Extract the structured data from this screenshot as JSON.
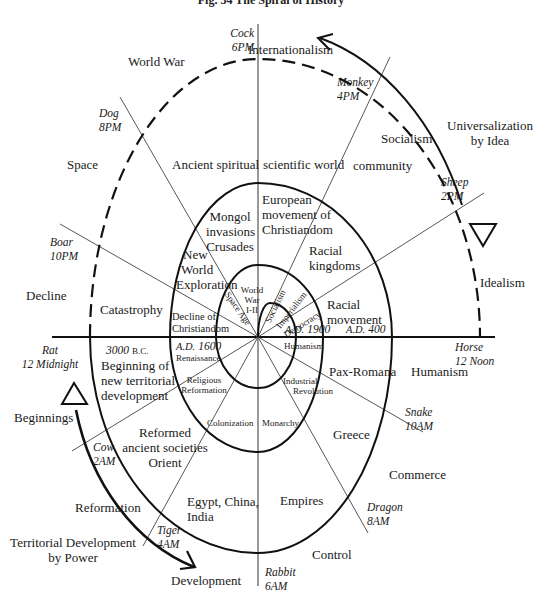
{
  "figure": {
    "title": "Fig. 34   The Spiral of History"
  },
  "time_markers": [
    {
      "animal": "Cock",
      "time": "6PM"
    },
    {
      "animal": "Monkey",
      "time": "4PM"
    },
    {
      "animal": "Sheep",
      "time": "2PM"
    },
    {
      "animal": "Horse",
      "time": "12 Noon"
    },
    {
      "animal": "Snake",
      "time": "10AM"
    },
    {
      "animal": "Dragon",
      "time": "8AM"
    },
    {
      "animal": "Rabbit",
      "time": "6AM"
    },
    {
      "animal": "Tiger",
      "time": "4AM"
    },
    {
      "animal": "Cow",
      "time": "2AM"
    },
    {
      "animal": "Rat",
      "time": "12 Midnight"
    },
    {
      "animal": "Boar",
      "time": "10PM"
    },
    {
      "animal": "Dog",
      "time": "8PM"
    }
  ],
  "outer_labels": {
    "internationalism": "Internationalism",
    "world_war": "World War",
    "space": "Space",
    "decline": "Decline",
    "beginnings": "Beginnings",
    "reformation": "Reformation",
    "territorial_dev_1": "Territorial Development",
    "territorial_dev_2": "by Power",
    "development": "Development",
    "control": "Control",
    "commerce": "Commerce",
    "humanism": "Humanism",
    "idealism": "Idealism",
    "universalization_1": "Universalization",
    "universalization_2": "by Idea",
    "socialism": "Socialism"
  },
  "ring1_labels": {
    "ancient_spiritual": "Ancient spiritual",
    "scientific_world": "scientific world",
    "community": "community",
    "catastrophy": "Catastrophy",
    "bc_3000": "3000",
    "bc_suffix": "B.C.",
    "beginning_1": "Beginning of",
    "beginning_2": "new territorial",
    "beginning_3": "development",
    "reformed_1": "Reformed",
    "reformed_2": "ancient societies",
    "reformed_3": "Orient",
    "egypt_1": "Egypt, China,",
    "egypt_2": "India",
    "empires": "Empires",
    "greece": "Greece",
    "pax_romana": "Pax-Romana",
    "racial_movement_1": "Racial",
    "racial_movement_2": "movement",
    "ad_400_prefix": "A.D.",
    "ad_400": "400"
  },
  "ring2_labels": {
    "mongol_1": "Mongol",
    "mongol_2": "invasions",
    "mongol_3": "Crusades",
    "european_1": "European",
    "european_2": "movement of",
    "european_3": "Christiandom",
    "racial_kingdoms_1": "Racial",
    "racial_kingdoms_2": "kingdoms",
    "new_world_1": "New",
    "new_world_2": "World",
    "new_world_3": "Exploration",
    "decline_christ_1": "Decline of",
    "decline_christ_2": "Christiandom",
    "ad_1600_prefix": "A.D.",
    "ad_1600": "1600",
    "renaissance": "Renaissance",
    "religious_1": "Religious",
    "religious_2": "Reformation",
    "colonization": "Colonization",
    "monarchy": "Monarchy",
    "industrial_1": "Industrial",
    "industrial_2": "Revolution",
    "humanism_inner": "Humanism",
    "ad_1900_prefix": "A.D.",
    "ad_1900": "1900"
  },
  "ring3_labels": {
    "world_war_1": "World",
    "world_war_2": "War",
    "world_war_3": "I-II",
    "space_age": "Space Age",
    "socialism": "Socialism",
    "imperialism": "Imperialism",
    "democracy": "Democracy"
  }
}
